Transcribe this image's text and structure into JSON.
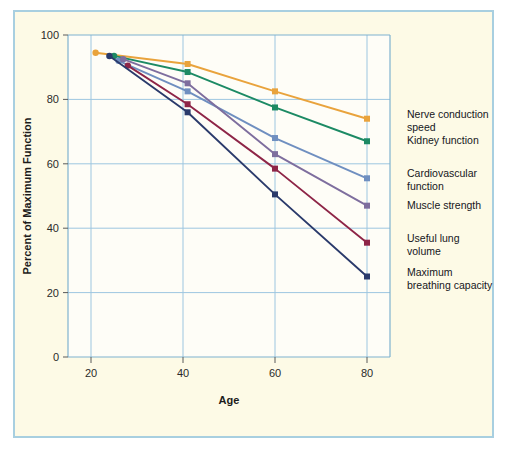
{
  "figure": {
    "border_color": "#a8cfe0",
    "background_color": "#fdfae6",
    "plot_background_color": "#fefdf7",
    "grid_color": "#9dc6e0"
  },
  "chart_data": {
    "type": "line",
    "title": "",
    "xlabel": "Age",
    "ylabel": "Percent of Maximum Function",
    "xlim": [
      15,
      85
    ],
    "ylim": [
      0,
      100
    ],
    "xticks": [
      20,
      40,
      60,
      80
    ],
    "yticks": [
      0,
      20,
      40,
      60,
      80,
      100
    ],
    "xtick_labels": [
      "20",
      "40",
      "60",
      "80"
    ],
    "ytick_labels": [
      "0",
      "20",
      "40",
      "60",
      "80",
      "100"
    ],
    "grid": true,
    "legend_position": "right-of-axes",
    "series": [
      {
        "name": "Nerve conduction speed",
        "color": "#e9a33c",
        "x": [
          21,
          41,
          60,
          80
        ],
        "values": [
          94.5,
          91.0,
          82.5,
          74.0
        ]
      },
      {
        "name": "Kidney function",
        "color": "#1c8a64",
        "x": [
          25,
          41,
          60,
          80
        ],
        "values": [
          93.5,
          88.5,
          77.5,
          67.0
        ]
      },
      {
        "name": "Cardiovascular function",
        "color": "#6f8fc0",
        "x": [
          26,
          41,
          60,
          80
        ],
        "values": [
          92.0,
          82.5,
          68.0,
          55.5
        ]
      },
      {
        "name": "Muscle strength",
        "color": "#7e6e9e",
        "x": [
          27,
          41,
          60,
          80
        ],
        "values": [
          92.5,
          85.0,
          63.0,
          47.0
        ]
      },
      {
        "name": "Useful lung volume",
        "color": "#8e2547",
        "x": [
          28,
          41,
          60,
          80
        ],
        "values": [
          90.5,
          78.5,
          58.5,
          35.5
        ]
      },
      {
        "name": "Maximum breathing capacity",
        "color": "#2a3a6b",
        "x": [
          24,
          41,
          60,
          80
        ],
        "values": [
          93.5,
          76.0,
          50.5,
          25.0
        ]
      }
    ]
  },
  "legend": {
    "entries": [
      {
        "line1": "Nerve conduction",
        "line2": "speed"
      },
      {
        "line1": "Kidney function",
        "line2": ""
      },
      {
        "line1": "Cardiovascular",
        "line2": "function"
      },
      {
        "line1": "Muscle strength",
        "line2": ""
      },
      {
        "line1": "Useful lung",
        "line2": "volume"
      },
      {
        "line1": "Maximum",
        "line2": "breathing capacity"
      }
    ]
  }
}
